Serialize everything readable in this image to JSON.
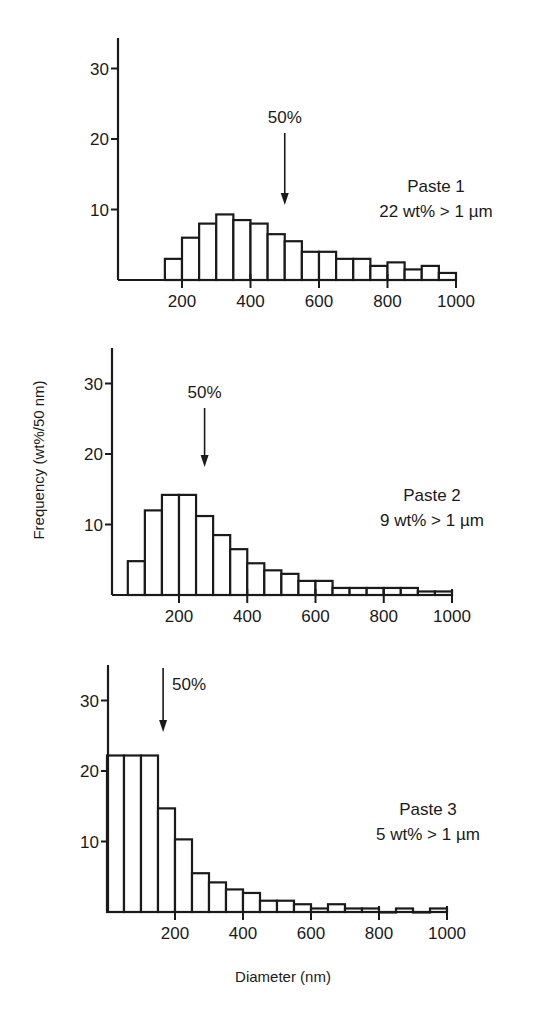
{
  "figure": {
    "ylabel": "Frequency (wt%/50 nm)",
    "xlabel": "Diameter (nm)"
  },
  "panels": [
    {
      "name": "Paste 1",
      "label_line1": "Paste 1",
      "label_line2": "22 wt% > 1 µm",
      "median_label": "50%",
      "median_nm": 500
    },
    {
      "name": "Paste 2",
      "label_line1": "Paste 2",
      "label_line2": "9 wt% > 1 µm",
      "median_label": "50%",
      "median_nm": 275
    },
    {
      "name": "Paste 3",
      "label_line1": "Paste 3",
      "label_line2": "5 wt% > 1 µm",
      "median_label": "50%",
      "median_nm": 165
    }
  ],
  "chart_data": [
    {
      "type": "bar",
      "title": "Paste 1",
      "subtitle": "22 wt% > 1 µm",
      "xlabel": "Diameter (nm)",
      "ylabel": "Frequency (wt%/50 nm)",
      "bin_width_nm": 50,
      "bin_starts": [
        150,
        200,
        250,
        300,
        350,
        400,
        450,
        500,
        550,
        600,
        650,
        700,
        750,
        800,
        850,
        900,
        950
      ],
      "values": [
        3,
        6,
        8,
        9.3,
        8.5,
        8,
        6.5,
        5.5,
        4,
        4,
        3,
        3,
        2,
        2.5,
        1.5,
        2,
        1
      ],
      "xticks": [
        200,
        400,
        600,
        800,
        1000
      ],
      "yticks": [
        10,
        20,
        30
      ],
      "xlim": [
        0,
        1000
      ],
      "ylim": [
        0,
        35
      ],
      "annotations": [
        {
          "text": "50%",
          "x": 500,
          "arrow": "down"
        }
      ],
      "grid": false
    },
    {
      "type": "bar",
      "title": "Paste 2",
      "subtitle": "9 wt% > 1 µm",
      "xlabel": "Diameter (nm)",
      "ylabel": "Frequency (wt%/50 nm)",
      "bin_width_nm": 50,
      "bin_starts": [
        50,
        100,
        150,
        200,
        250,
        300,
        350,
        400,
        450,
        500,
        550,
        600,
        650,
        700,
        750,
        800,
        850,
        900,
        950
      ],
      "values": [
        4.8,
        12,
        14.2,
        14.2,
        11.2,
        8.5,
        6.5,
        4.5,
        3.5,
        3,
        2,
        2,
        1,
        1,
        1,
        1,
        1,
        0.5,
        0.5
      ],
      "xticks": [
        200,
        400,
        600,
        800,
        1000
      ],
      "yticks": [
        10,
        20,
        30
      ],
      "xlim": [
        0,
        1000
      ],
      "ylim": [
        0,
        35
      ],
      "annotations": [
        {
          "text": "50%",
          "x": 275,
          "arrow": "down"
        }
      ],
      "grid": false
    },
    {
      "type": "bar",
      "title": "Paste 3",
      "subtitle": "5 wt% > 1 µm",
      "xlabel": "Diameter (nm)",
      "ylabel": "Frequency (wt%/50 nm)",
      "bin_width_nm": 50,
      "bin_starts": [
        0,
        50,
        100,
        150,
        200,
        250,
        300,
        350,
        400,
        450,
        500,
        550,
        600,
        650,
        700,
        750,
        800,
        850,
        900,
        950
      ],
      "values": [
        22.2,
        22.2,
        22.2,
        14.7,
        10.3,
        5.5,
        4.2,
        3.2,
        2.7,
        1.6,
        1.6,
        1.1,
        0.5,
        1.1,
        0.5,
        0.5,
        0,
        0.5,
        0,
        0.5
      ],
      "xticks": [
        200,
        400,
        600,
        800,
        1000
      ],
      "yticks": [
        10,
        20,
        30
      ],
      "xlim": [
        0,
        1000
      ],
      "ylim": [
        0,
        35
      ],
      "annotations": [
        {
          "text": "50%",
          "x": 165,
          "arrow": "down"
        }
      ],
      "grid": false
    }
  ]
}
